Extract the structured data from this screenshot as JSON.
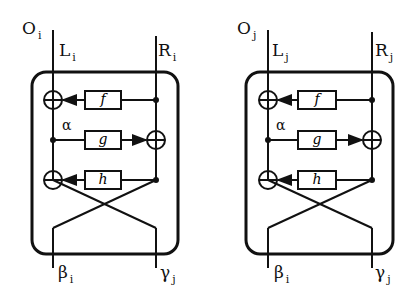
{
  "diagram": {
    "units": [
      {
        "name": "O",
        "sub": "i",
        "left_in": "L",
        "left_in_sub": "i",
        "right_in": "R",
        "right_in_sub": "i",
        "alpha": "α",
        "f": "f",
        "g": "g",
        "h": "h",
        "left_out": "β",
        "left_out_sub": "i",
        "right_out": "γ",
        "right_out_sub": "j"
      },
      {
        "name": "O",
        "sub": "j",
        "left_in": "L",
        "left_in_sub": "j",
        "right_in": "R",
        "right_in_sub": "j",
        "alpha": "α",
        "f": "f",
        "g": "g",
        "h": "h",
        "left_out": "β",
        "left_out_sub": "i",
        "right_out": "γ",
        "right_out_sub": "j"
      }
    ]
  }
}
